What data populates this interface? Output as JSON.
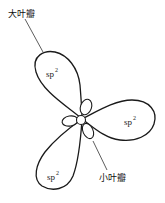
{
  "diagram": {
    "type": "sp2 hybrid orbitals",
    "labels": {
      "large_lobe": "大叶瓣",
      "small_lobe": "小叶瓣"
    },
    "orbitals": [
      {
        "position": "upper-left",
        "label": "sp",
        "superscript": "2"
      },
      {
        "position": "right",
        "label": "sp",
        "superscript": "2"
      },
      {
        "position": "lower-left",
        "label": "sp",
        "superscript": "2"
      }
    ],
    "colors": {
      "stroke": "#1a1a1a",
      "background": "#ffffff"
    }
  }
}
